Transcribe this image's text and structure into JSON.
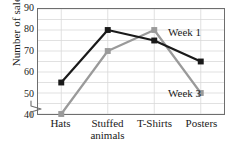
{
  "chart_data": {
    "type": "line",
    "title": "",
    "xlabel": "",
    "ylabel": "Number of sales",
    "categories": [
      "Hats",
      "Stuffed animals",
      "T-Shirts",
      "Posters"
    ],
    "category_lines": [
      [
        "Hats"
      ],
      [
        "Stuffed",
        "animals"
      ],
      [
        "T-Shirts"
      ],
      [
        "Posters"
      ]
    ],
    "series": [
      {
        "name": "Week 1",
        "values": [
          55,
          80,
          75,
          65
        ],
        "color": "#1a1a1a",
        "marker": "square"
      },
      {
        "name": "Week 3",
        "values": [
          40,
          70,
          80,
          50
        ],
        "color": "#9a9a9a",
        "marker": "square"
      }
    ],
    "ylim": [
      40,
      90
    ],
    "yticks": [
      40,
      50,
      60,
      70,
      80,
      90
    ],
    "ytick_labels": [
      "40",
      "50",
      "60",
      "70",
      "80",
      "90"
    ],
    "minor_tick_step": 5,
    "grid": true,
    "grid_color": "#d9d9d9",
    "axis_break": true,
    "legend_position": "inline-annotations",
    "annotations": [
      {
        "text": "Week 1",
        "series": "Week 1"
      },
      {
        "text": "Week 3",
        "series": "Week 3"
      }
    ]
  },
  "axis": {
    "frame_color": "#6e6e6e"
  }
}
